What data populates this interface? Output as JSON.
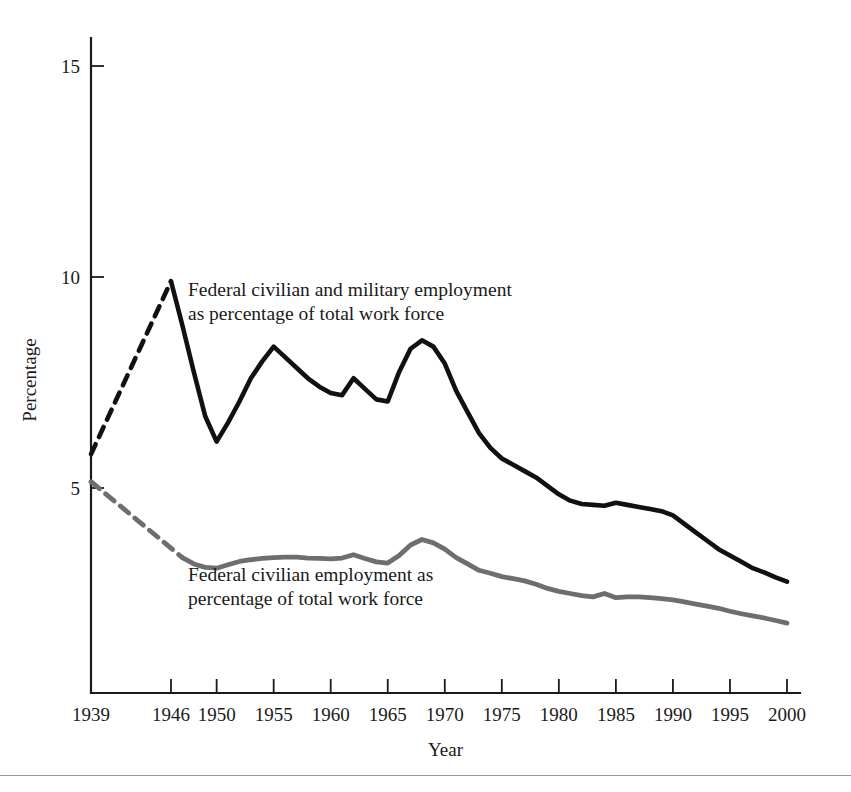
{
  "figure": {
    "background_color": "#ffffff",
    "series_colors": {
      "federal_total": "#111111",
      "federal_civilian": "#6e6e6e"
    }
  },
  "annotations": [
    {
      "name": "annotation-federal-total",
      "line1": "Federal civilian and military employment",
      "line2": "as percentage of total work force",
      "x": 188,
      "y": 296
    },
    {
      "name": "annotation-federal-civilian",
      "line1": "Federal civilian employment as",
      "line2": "percentage of total work force",
      "x": 188,
      "y": 581
    }
  ],
  "chart_data": {
    "type": "line",
    "title": "",
    "xlabel": "Year",
    "ylabel": "Percentage",
    "xlim": [
      1939,
      2000
    ],
    "ylim": [
      0.15,
      16
    ],
    "grid": false,
    "legend_position": "inline-annotations",
    "xticks": [
      "1939",
      "1946",
      "1950",
      "1955",
      "1960",
      "1965",
      "1970",
      "1975",
      "1980",
      "1985",
      "1990",
      "1995",
      "2000"
    ],
    "xtick_values": [
      1939,
      1946,
      1950,
      1955,
      1960,
      1965,
      1970,
      1975,
      1980,
      1985,
      1990,
      1995,
      2000
    ],
    "yticks": [
      "5",
      "10",
      "15"
    ],
    "ytick_values": [
      5,
      10,
      15
    ],
    "series": [
      {
        "name": "Federal civilian and military employment as percentage of total work force",
        "color": "#111111",
        "style": "solid",
        "dashed_segment_years": [
          1939,
          1946
        ],
        "x": [
          1939,
          1946,
          1947,
          1948,
          1949,
          1950,
          1951,
          1952,
          1953,
          1954,
          1955,
          1956,
          1957,
          1958,
          1959,
          1960,
          1961,
          1962,
          1963,
          1964,
          1965,
          1966,
          1967,
          1968,
          1969,
          1970,
          1971,
          1972,
          1973,
          1974,
          1975,
          1976,
          1977,
          1978,
          1979,
          1980,
          1981,
          1982,
          1983,
          1984,
          1985,
          1986,
          1987,
          1988,
          1989,
          1990,
          1991,
          1992,
          1993,
          1994,
          1995,
          1996,
          1997,
          1998,
          1999,
          2000
        ],
        "y": [
          5.8,
          9.9,
          8.85,
          7.75,
          6.7,
          6.1,
          6.55,
          7.05,
          7.6,
          8.0,
          8.35,
          8.1,
          7.85,
          7.6,
          7.4,
          7.25,
          7.2,
          7.6,
          7.35,
          7.1,
          7.05,
          7.75,
          8.3,
          8.5,
          8.35,
          7.95,
          7.3,
          6.8,
          6.3,
          5.95,
          5.7,
          5.55,
          5.4,
          5.25,
          5.05,
          4.85,
          4.7,
          4.62,
          4.6,
          4.58,
          4.65,
          4.6,
          4.55,
          4.5,
          4.45,
          4.35,
          4.15,
          3.95,
          3.75,
          3.55,
          3.4,
          3.25,
          3.1,
          3.0,
          2.88,
          2.78
        ]
      },
      {
        "name": "Federal civilian employment as percentage of total work force",
        "color": "#6e6e6e",
        "style": "solid",
        "dashed_segment_years": [
          1939,
          1947
        ],
        "x": [
          1939,
          1947,
          1948,
          1949,
          1950,
          1951,
          1952,
          1953,
          1954,
          1955,
          1956,
          1957,
          1958,
          1959,
          1960,
          1961,
          1962,
          1963,
          1964,
          1965,
          1966,
          1967,
          1968,
          1969,
          1970,
          1971,
          1972,
          1973,
          1974,
          1975,
          1976,
          1977,
          1978,
          1979,
          1980,
          1981,
          1982,
          1983,
          1984,
          1985,
          1986,
          1987,
          1988,
          1989,
          1990,
          1991,
          1992,
          1993,
          1994,
          1995,
          1996,
          1997,
          1998,
          1999,
          2000
        ],
        "y": [
          5.15,
          3.35,
          3.2,
          3.12,
          3.1,
          3.18,
          3.26,
          3.3,
          3.33,
          3.35,
          3.36,
          3.36,
          3.34,
          3.33,
          3.32,
          3.34,
          3.42,
          3.33,
          3.25,
          3.22,
          3.4,
          3.65,
          3.78,
          3.7,
          3.55,
          3.35,
          3.2,
          3.05,
          2.98,
          2.9,
          2.85,
          2.8,
          2.72,
          2.62,
          2.55,
          2.5,
          2.45,
          2.42,
          2.5,
          2.4,
          2.42,
          2.42,
          2.4,
          2.38,
          2.35,
          2.3,
          2.25,
          2.2,
          2.15,
          2.08,
          2.02,
          1.97,
          1.92,
          1.86,
          1.8
        ]
      }
    ]
  }
}
